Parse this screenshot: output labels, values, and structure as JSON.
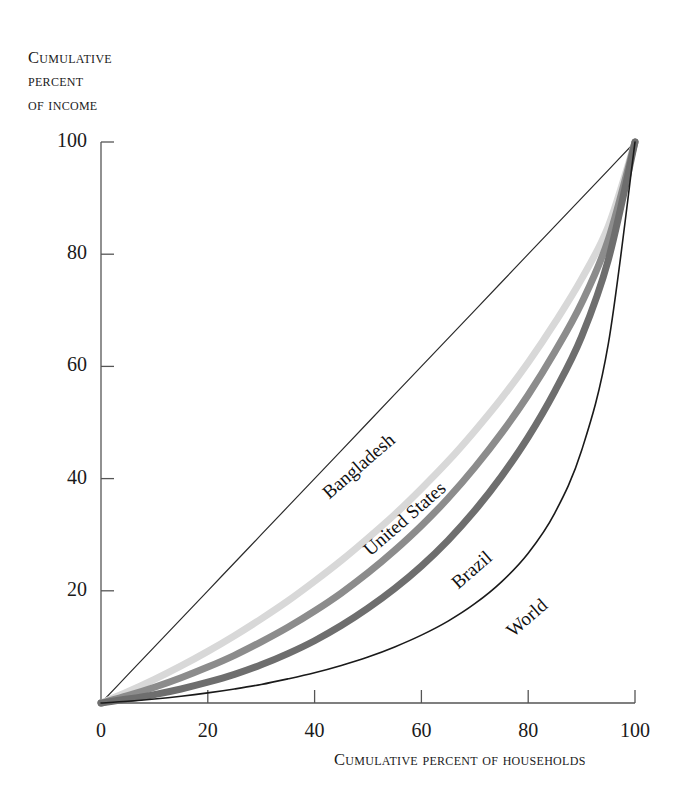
{
  "chart_data": {
    "type": "line",
    "title": "",
    "subtitle": "",
    "xlabel": "Cumulative percent of households",
    "ylabel": "Cumulative percent of income",
    "xlim": [
      0,
      100
    ],
    "ylim": [
      0,
      100
    ],
    "grid": false,
    "legend_position": "inline-curve-labels",
    "xticks": [
      "0",
      "20",
      "40",
      "60",
      "80",
      "100"
    ],
    "xtick_values": [
      0,
      20,
      40,
      60,
      80,
      100
    ],
    "yticks": [
      "20",
      "40",
      "60",
      "80",
      "100"
    ],
    "ytick_values": [
      20,
      40,
      60,
      80,
      100
    ],
    "origin_label": "0",
    "x": [
      0,
      5,
      10,
      15,
      20,
      25,
      30,
      35,
      40,
      45,
      50,
      55,
      60,
      65,
      70,
      75,
      80,
      85,
      90,
      95,
      100
    ],
    "series": [
      {
        "name": "Line of equality",
        "label_shown": false,
        "color": "#2b2b2b",
        "width": 1.2,
        "values": [
          0,
          5,
          10,
          15,
          20,
          25,
          30,
          35,
          40,
          45,
          50,
          55,
          60,
          65,
          70,
          75,
          80,
          85,
          90,
          95,
          100
        ]
      },
      {
        "name": "Bangladesh",
        "label_shown": true,
        "color": "#d8d8d8",
        "width": 7,
        "values": [
          0,
          2.0,
          4.2,
          6.6,
          9.2,
          12.0,
          15.0,
          18.2,
          21.7,
          25.4,
          29.4,
          33.6,
          38.2,
          43.1,
          48.5,
          54.3,
          60.7,
          67.8,
          75.6,
          85.0,
          100
        ]
      },
      {
        "name": "United States",
        "label_shown": true,
        "color": "#8c8c8c",
        "width": 7,
        "values": [
          0,
          1.3,
          2.8,
          4.5,
          6.4,
          8.5,
          10.9,
          13.5,
          16.4,
          19.6,
          23.2,
          27.2,
          31.6,
          36.5,
          42.0,
          48.1,
          54.9,
          62.6,
          71.3,
          82.6,
          100
        ]
      },
      {
        "name": "Brazil",
        "label_shown": true,
        "color": "#6e6e6e",
        "width": 7,
        "values": [
          0,
          0.7,
          1.5,
          2.5,
          3.7,
          5.1,
          6.8,
          8.8,
          11.1,
          13.8,
          16.9,
          20.4,
          24.4,
          29.0,
          34.3,
          40.4,
          47.4,
          55.6,
          65.3,
          79.0,
          100
        ]
      },
      {
        "name": "World",
        "label_shown": true,
        "color": "#1a1a1a",
        "width": 1.6,
        "values": [
          0,
          0.3,
          0.7,
          1.2,
          1.8,
          2.5,
          3.3,
          4.3,
          5.4,
          6.7,
          8.2,
          10.0,
          12.1,
          14.6,
          17.7,
          21.6,
          26.7,
          33.9,
          45.0,
          64.0,
          100
        ]
      }
    ],
    "curve_labels": [
      {
        "text": "Bangladesh",
        "x": 318,
        "y": 487,
        "rotation": -41
      },
      {
        "text": "United States",
        "x": 359,
        "y": 544,
        "rotation": -41
      },
      {
        "text": "Brazil",
        "x": 447,
        "y": 577,
        "rotation": -41
      },
      {
        "text": "World",
        "x": 502,
        "y": 625,
        "rotation": -41
      }
    ]
  },
  "axes": {
    "y_title_lines": [
      "Cumulative",
      "percent",
      "of income"
    ],
    "x_title": "Cumulative percent of households"
  },
  "colors": {
    "background": "#ffffff",
    "axis": "#555555",
    "text": "#1a1a1a",
    "equality": "#2b2b2b",
    "bangladesh": "#d8d8d8",
    "united_states": "#8c8c8c",
    "brazil": "#6e6e6e",
    "world": "#1a1a1a"
  }
}
